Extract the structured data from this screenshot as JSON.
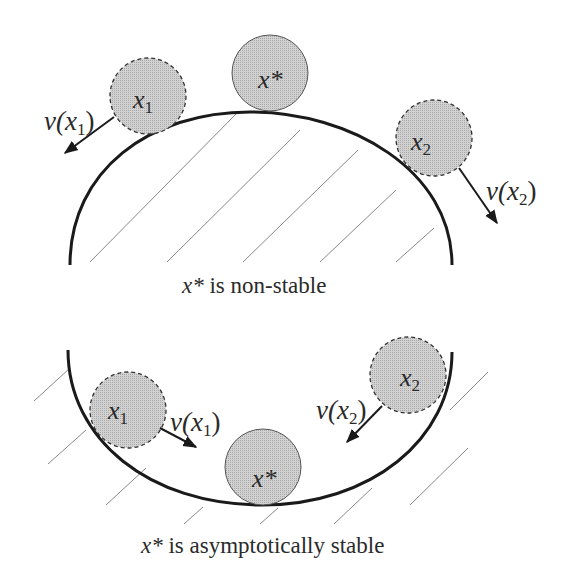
{
  "colors": {
    "ball_fill": "#c8c8c8",
    "stroke": "#1a1a1a",
    "hatch": "#777777",
    "background": "#ffffff"
  },
  "top_panel": {
    "caption_var": "x*",
    "caption_text": " is non-stable",
    "balls": [
      {
        "name": "x1",
        "var": "x",
        "sub": "1",
        "style": "dashed"
      },
      {
        "name": "x-star",
        "var": "x*",
        "sub": "",
        "style": "solid"
      },
      {
        "name": "x2",
        "var": "x",
        "sub": "2",
        "style": "dashed"
      }
    ],
    "velocity_labels": [
      {
        "fn": "v(",
        "var": "x",
        "sub": "1",
        "close": ")"
      },
      {
        "fn": "v(",
        "var": "x",
        "sub": "2",
        "close": ")"
      }
    ]
  },
  "bottom_panel": {
    "caption_var": "x*",
    "caption_text": " is asymptotically stable",
    "balls": [
      {
        "name": "x1",
        "var": "x",
        "sub": "1",
        "style": "dashed"
      },
      {
        "name": "x-star",
        "var": "x*",
        "sub": "",
        "style": "solid"
      },
      {
        "name": "x2",
        "var": "x",
        "sub": "2",
        "style": "dashed"
      }
    ],
    "velocity_labels": [
      {
        "fn": "v(",
        "var": "x",
        "sub": "1",
        "close": ")"
      },
      {
        "fn": "v(",
        "var": "x",
        "sub": "2",
        "close": ")"
      }
    ]
  }
}
